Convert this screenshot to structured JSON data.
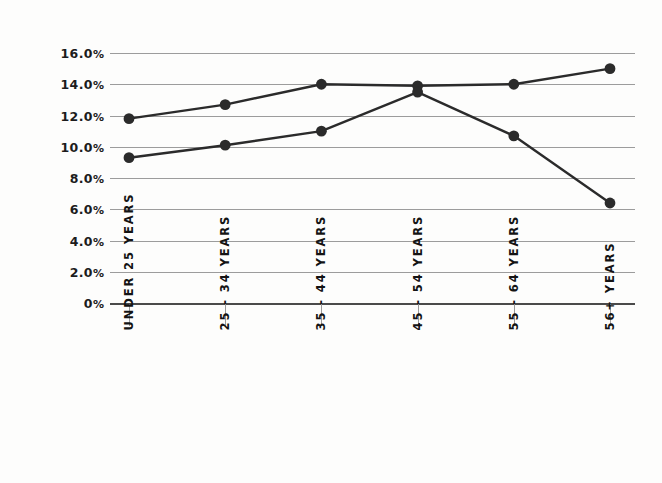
{
  "chart_data": {
    "type": "line",
    "title": "",
    "subtitle": "",
    "xlabel": "",
    "ylabel": "",
    "categories": [
      "UNDER 25 YEARS",
      "25 - 34 YEARS",
      "35 - 44 YEARS",
      "45 - 54 YEARS",
      "55 - 64 YEARS",
      "56+ YEARS"
    ],
    "series": [
      {
        "name": "series-1",
        "values": [
          11.8,
          12.7,
          14.0,
          13.9,
          14.0,
          15.0
        ],
        "color": "#2b2b2b"
      },
      {
        "name": "series-2",
        "values": [
          9.3,
          10.1,
          11.0,
          13.5,
          10.7,
          6.4
        ],
        "color": "#2b2b2b"
      }
    ],
    "ylim": [
      0,
      16
    ],
    "ytick_values": [
      16.0,
      14.0,
      12.0,
      10.0,
      8.0,
      6.0,
      4.0,
      2.0,
      0
    ],
    "ytick_labels": [
      "16.0%",
      "14.0%",
      "12.0%",
      "10.0%",
      "8.0%",
      "6.0%",
      "4.0%",
      "2.0%",
      "0%"
    ],
    "grid": true,
    "legend": "none",
    "marker": "filled-circle",
    "gridline_color": "#9c9c9c",
    "baseline_color": "#4a4a4a",
    "background_color": "#fdfdfc"
  }
}
